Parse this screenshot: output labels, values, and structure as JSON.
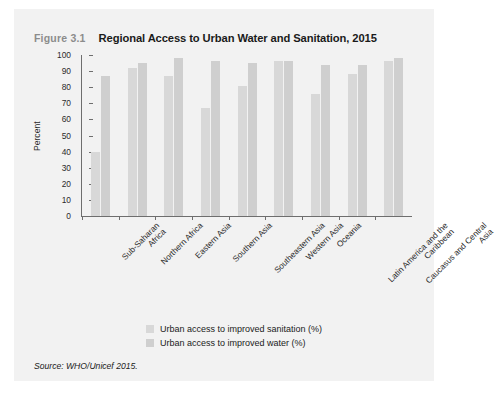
{
  "figure": {
    "number": "Figure 3.1",
    "title": "Regional Access to Urban Water and Sanitation, 2015"
  },
  "source": {
    "label": "Source:",
    "text": " WHO/Unicef 2015."
  },
  "colors": {
    "card_background": "#f2f2f2",
    "sanitation_bar": "#d8d8d8",
    "water_bar": "#cfcfcf",
    "axis": "#6e6e6e",
    "title_text": "#1a1a1a",
    "figure_number_text": "#8c8c8c"
  },
  "chart_data": {
    "type": "bar",
    "title": "Regional Access to Urban Water and Sanitation, 2015",
    "xlabel": "",
    "ylabel": "Percent",
    "ylim": [
      0,
      100
    ],
    "yticks": [
      0,
      10,
      20,
      30,
      40,
      50,
      60,
      70,
      80,
      90,
      100
    ],
    "grid": false,
    "legend_position": "bottom",
    "categories": [
      "Sub-Saharan\nAfrica",
      "Northern Africa",
      "Eastern Asia",
      "Southern Asia",
      "Southeastern Asia",
      "Western Asia",
      "Oceania",
      "Latin America and the\nCaribbean",
      "Caucasus and Central\nAsia"
    ],
    "series": [
      {
        "name": "Urban access to improved sanitation (%)",
        "values": [
          40,
          92,
          87,
          67,
          81,
          96,
          76,
          88,
          96
        ]
      },
      {
        "name": "Urban access to improved water (%)",
        "values": [
          87,
          95,
          98,
          96,
          95,
          96,
          94,
          94,
          98
        ]
      }
    ]
  }
}
